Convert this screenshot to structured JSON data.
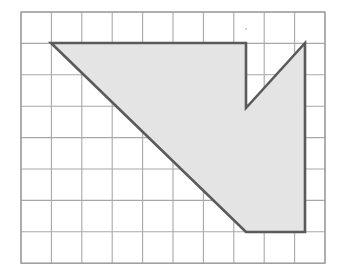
{
  "figure": {
    "background_color": "#ffffff"
  },
  "grid": {
    "name": "square-grid",
    "origin_x": 21,
    "origin_y": 12,
    "cell_width": 30.4,
    "cell_height": 31.4,
    "columns": 10,
    "rows": 8,
    "line_color": "#a8a8a8",
    "line_width": 1.1,
    "border_color": "#9c9c9c",
    "border_width": 1.3
  },
  "shape": {
    "name": "shaded-polygon",
    "fill_color": "#e4e4e4",
    "stroke_color": "#5a5a5a",
    "stroke_width": 2.6,
    "vertices_grid": [
      {
        "label": "top-left-corner",
        "col": 1.0,
        "row": 1.0
      },
      {
        "label": "top-right-of-notch-start",
        "col": 7.4,
        "row": 1.0
      },
      {
        "label": "notch-bottom-left",
        "col": 7.4,
        "row": 3.05
      },
      {
        "label": "notch-top-right",
        "col": 9.35,
        "row": 1.0
      },
      {
        "label": "right-bottom-corner",
        "col": 9.35,
        "row": 7.0
      },
      {
        "label": "bottom-left-corner",
        "col": 7.4,
        "row": 7.0
      }
    ],
    "vertices_px": [
      {
        "label": "top-left-corner",
        "x": 51,
        "y": 43
      },
      {
        "label": "top-right-of-notch-start",
        "x": 246,
        "y": 43
      },
      {
        "label": "notch-bottom-left",
        "x": 246,
        "y": 108
      },
      {
        "label": "notch-top-right",
        "x": 305,
        "y": 43
      },
      {
        "label": "right-bottom-corner",
        "x": 305,
        "y": 232
      },
      {
        "label": "bottom-left-corner",
        "x": 246,
        "y": 232
      }
    ],
    "edges": [
      {
        "name": "top-edge",
        "from": "top-left-corner",
        "to": "top-right-of-notch-start"
      },
      {
        "name": "notch-left-edge",
        "from": "top-right-of-notch-start",
        "to": "notch-bottom-left"
      },
      {
        "name": "notch-right-diagonal",
        "from": "notch-bottom-left",
        "to": "notch-top-right"
      },
      {
        "name": "right-edge",
        "from": "notch-top-right",
        "to": "right-bottom-corner"
      },
      {
        "name": "bottom-edge",
        "from": "right-bottom-corner",
        "to": "bottom-left-corner"
      },
      {
        "name": "main-diagonal",
        "from": "bottom-left-corner",
        "to": "top-left-corner"
      }
    ]
  },
  "artifact": {
    "name": "scan-speck",
    "x": 246,
    "y": 29,
    "radius": 0.9,
    "color": "#b9b9b9"
  }
}
